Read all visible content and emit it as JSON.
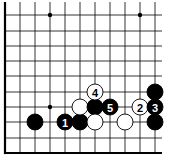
{
  "diagram": {
    "type": "go-board-fragment",
    "grid": {
      "columns_x": [
        5,
        20,
        35,
        50,
        65,
        80,
        95,
        110,
        125,
        140,
        155
      ],
      "rows_y": [
        15,
        31,
        46,
        61,
        76,
        92,
        107,
        122,
        138,
        153
      ],
      "left_edge": true,
      "bottom_edge": true,
      "line_color": "#000000",
      "top_extent": 2,
      "right_extent": 162
    },
    "star_points": [
      {
        "x": 50,
        "y": 15
      },
      {
        "x": 140,
        "y": 15
      },
      {
        "x": 50,
        "y": 107
      }
    ],
    "stones": [
      {
        "color": "black",
        "x": 35,
        "y": 122,
        "label": ""
      },
      {
        "color": "black",
        "x": 65,
        "y": 122,
        "label": "1"
      },
      {
        "color": "black",
        "x": 80,
        "y": 122,
        "label": ""
      },
      {
        "color": "white",
        "x": 80,
        "y": 107,
        "label": ""
      },
      {
        "color": "black",
        "x": 95,
        "y": 107,
        "label": ""
      },
      {
        "color": "white",
        "x": 95,
        "y": 122,
        "label": ""
      },
      {
        "color": "white",
        "x": 95,
        "y": 92,
        "label": "4"
      },
      {
        "color": "black",
        "x": 110,
        "y": 107,
        "label": "5"
      },
      {
        "color": "white",
        "x": 125,
        "y": 122,
        "label": ""
      },
      {
        "color": "white",
        "x": 140,
        "y": 107,
        "label": "2"
      },
      {
        "color": "black",
        "x": 155,
        "y": 107,
        "label": "3"
      },
      {
        "color": "black",
        "x": 155,
        "y": 92,
        "label": ""
      },
      {
        "color": "black",
        "x": 155,
        "y": 122,
        "label": ""
      }
    ],
    "stone_radius": 8
  }
}
